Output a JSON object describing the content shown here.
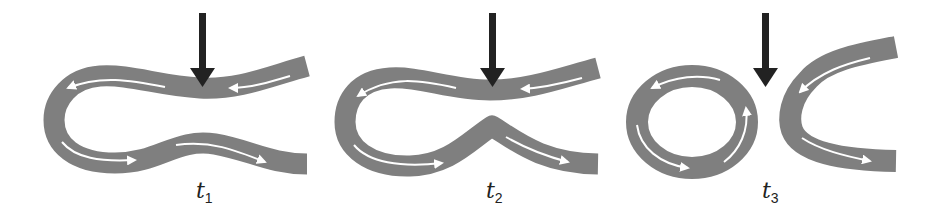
{
  "colors": {
    "band": "#7f7f7f",
    "flow_arrow": "#ffffff",
    "pointer_arrow": "#222222",
    "background": "#ffffff"
  },
  "panels": [
    {
      "id": "t1",
      "label_var": "t",
      "label_sub": "1",
      "description": "Meander loop with narrowing neck; downward arrow indicates neck position"
    },
    {
      "id": "t2",
      "label_var": "t",
      "label_sub": "2",
      "description": "Neck narrowed further; loop about to pinch off"
    },
    {
      "id": "t3",
      "label_var": "t",
      "label_sub": "3",
      "description": "Loop pinched off into closed ring, remaining channel forms C-shape"
    }
  ]
}
